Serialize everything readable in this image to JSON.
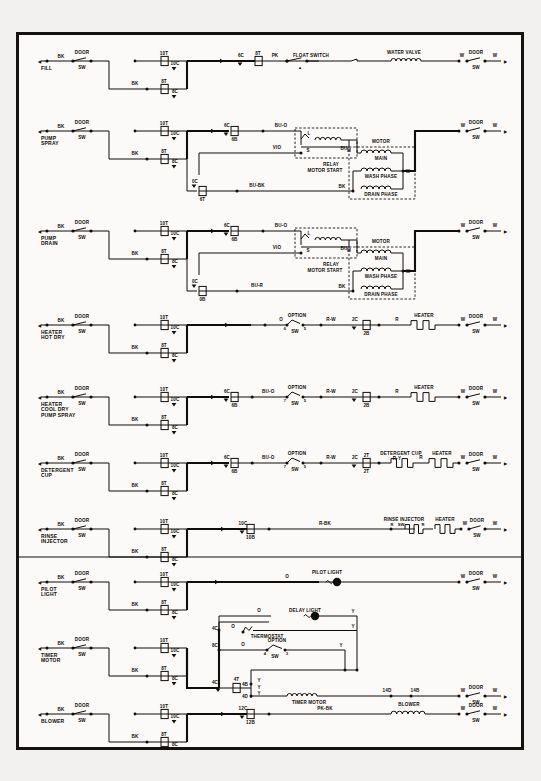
{
  "document": {
    "title": "Dishwasher Ladder Wiring Schematic",
    "background_color": "#f2f1ef",
    "ink_color": "#100d0a",
    "border_color": "#15120f"
  },
  "common": {
    "door": "DOOR",
    "sw": "SW",
    "bk": "BK",
    "w": "W",
    "option": "OPTION",
    "heater": "HEATER",
    "motor": "MOTOR",
    "relay": "RELAY",
    "motor_start": "MOTOR START",
    "main": "MAIN",
    "wash_phase": "WASH PHASE",
    "drain_phase": "DRAIN PHASE",
    "term_10t": "10T",
    "term_10c": "10C",
    "term_8t": "8T",
    "term_8c": "8C",
    "term_6c": "6C",
    "term_6b": "6B",
    "term_6t": "6T",
    "term_0c": "0C",
    "term_0b": "0B",
    "term_2c": "2C",
    "term_2b": "2B",
    "term_2t": "2T",
    "term_10b": "10B",
    "term_12c": "12C",
    "term_12b": "12B",
    "term_4c": "4C",
    "term_4t": "4T",
    "term_4b": "4B",
    "term_4d": "4D",
    "term_8c_low": "8C",
    "term_14d": "14D",
    "term_14b": "14B"
  },
  "rows": [
    {
      "id": "fill",
      "name": "FILL",
      "left_wire": "BK",
      "switch": "DOOR",
      "switch_sub": "SW",
      "mid_wire": "BK",
      "terminals": [
        "10T",
        "10C",
        "8T",
        "8C",
        "6C",
        "8T"
      ],
      "load_wire": "PK",
      "device_a": "FLOAT SWITCH",
      "device_b": "WATER VALVE",
      "right_wire": "W",
      "right_switch": "DOOR",
      "right_switch_sub": "SW",
      "right_end": "W"
    },
    {
      "id": "pump-spray",
      "name": "PUMP SPRAY",
      "name_line1": "PUMP",
      "name_line2": "SPRAY",
      "left_wire": "BK",
      "switch": "DOOR",
      "switch_sub": "SW",
      "mid_wire": "BK",
      "terminals": [
        "10T",
        "10C",
        "8T",
        "8C",
        "6C",
        "6B",
        "0C",
        "6T"
      ],
      "relay_wire_top": "BU-O",
      "relay_wire_mid": "VIO",
      "relay_wire_bot": "BU-BK",
      "relay_terms": [
        "L",
        "S",
        "M"
      ],
      "relay_title1": "RELAY",
      "relay_title2": "MOTOR START",
      "motor_title": "MOTOR",
      "motor_coils": [
        "MAIN",
        "WASH PHASE",
        "DRAIN PHASE"
      ],
      "motor_in_top": "BU",
      "motor_in_bot": "BK",
      "motor_out": "W",
      "right_wire": "W",
      "right_switch": "DOOR",
      "right_switch_sub": "SW",
      "right_end": "W"
    },
    {
      "id": "pump-drain",
      "name": "PUMP DRAIN",
      "name_line1": "PUMP",
      "name_line2": "DRAIN",
      "left_wire": "BK",
      "switch": "DOOR",
      "switch_sub": "SW",
      "mid_wire": "BK",
      "terminals": [
        "10T",
        "10C",
        "8T",
        "8C",
        "6C",
        "6B",
        "0C",
        "0B"
      ],
      "relay_wire_top": "BU-O",
      "relay_wire_mid": "VIO",
      "relay_wire_bot": "BU-R",
      "relay_terms": [
        "L",
        "S",
        "M"
      ],
      "relay_title1": "RELAY",
      "relay_title2": "MOTOR START",
      "motor_title": "MOTOR",
      "motor_coils": [
        "MAIN",
        "WASH PHASE",
        "DRAIN PHASE"
      ],
      "motor_in_top": "BU",
      "motor_in_bot": "BK",
      "motor_out": "W",
      "right_wire": "W",
      "right_switch": "DOOR",
      "right_switch_sub": "SW",
      "right_end": "W"
    },
    {
      "id": "heater-hot-dry",
      "name": "HEATER HOT DRY",
      "name_line1": "HEATER",
      "name_line2": "HOT DRY",
      "left_wire": "BK",
      "switch": "DOOR",
      "switch_sub": "SW",
      "mid_wire": "BK",
      "terminals": [
        "10T",
        "10C",
        "8T",
        "8C",
        "2C",
        "2B"
      ],
      "opt_wire_in": "O",
      "opt_title": "OPTION",
      "opt_sub": "SW",
      "opt_terms": [
        "6",
        "5"
      ],
      "opt_wire_out": "R-W",
      "load_wire": "R",
      "device": "HEATER",
      "right_wire": "W",
      "right_switch": "DOOR",
      "right_switch_sub": "SW",
      "right_end": "W"
    },
    {
      "id": "heater-cool-dry-pump-spray",
      "name": "HEATER COOL DRY PUMP SPRAY",
      "name_line1": "HEATER",
      "name_line2": "COOL DRY",
      "name_line3": "PUMP SPRAY",
      "left_wire": "BK",
      "switch": "DOOR",
      "switch_sub": "SW",
      "mid_wire": "BK",
      "terminals": [
        "10T",
        "10C",
        "8T",
        "8C",
        "6C",
        "6B",
        "2C",
        "2B"
      ],
      "opt_wire_in": "BU-O",
      "opt_title": "OPTION",
      "opt_sub": "SW",
      "opt_terms": [
        "7",
        "5"
      ],
      "opt_wire_out": "R-W",
      "load_wire": "R",
      "device": "HEATER",
      "right_wire": "W",
      "right_switch": "DOOR",
      "right_switch_sub": "SW",
      "right_end": "W"
    },
    {
      "id": "detergent-cup",
      "name": "DETERGENT CUP",
      "name_line1": "DETERGENT",
      "name_line2": "CUP",
      "left_wire": "BK",
      "switch": "DOOR",
      "switch_sub": "SW",
      "mid_wire": "BK",
      "terminals": [
        "10T",
        "10C",
        "8T",
        "8C",
        "6C",
        "6B",
        "2C",
        "2T"
      ],
      "opt_wire_in": "BU-O",
      "opt_title": "OPTION",
      "opt_sub": "SW",
      "opt_terms": [
        "7",
        "5"
      ],
      "opt_wire_out": "R-W",
      "device_a": "DETERGENT CUP",
      "device_a_wire": "R-Y",
      "load_wire": "R",
      "device": "HEATER",
      "right_wire": "W",
      "right_switch": "DOOR",
      "right_switch_sub": "SW",
      "right_end": "W"
    },
    {
      "id": "rinse-injector",
      "name": "RINSE INJECTOR",
      "name_line1": "RINSE",
      "name_line2": "INJECTOR",
      "left_wire": "BK",
      "switch": "DOOR",
      "switch_sub": "SW",
      "mid_wire": "BK",
      "terminals": [
        "10T",
        "10C",
        "8T",
        "8C",
        "10C",
        "10B"
      ],
      "load_wire": "R-BK",
      "device_a": "RINSE INJECTOR",
      "device_a_in": "R",
      "device_a_out": "R",
      "device_a_sub": "SW",
      "device": "HEATER",
      "right_wire": "W",
      "right_switch": "DOOR",
      "right_switch_sub": "SW",
      "right_end": "W"
    },
    {
      "id": "pilot-light",
      "name": "PILOT LIGHT",
      "name_line1": "PILOT",
      "name_line2": "LIGHT",
      "left_wire": "BK",
      "switch": "DOOR",
      "switch_sub": "SW",
      "mid_wire": "BK",
      "terminals": [
        "10T",
        "10C",
        "8T",
        "8C"
      ],
      "load_wire": "O",
      "device": "PILOT LIGHT",
      "right_wire": "W",
      "right_switch": "DOOR",
      "right_switch_sub": "SW",
      "right_end": "W"
    },
    {
      "id": "timer-motor",
      "name": "TIMER MOTOR",
      "name_line1": "TIMER",
      "name_line2": "MOTOR",
      "left_wire": "BK",
      "switch": "DOOR",
      "switch_sub": "SW",
      "mid_wire": "BK",
      "terminals": [
        "10T",
        "10C",
        "8T",
        "8C",
        "4C",
        "4T",
        "4B",
        "4D",
        "8C",
        "14D",
        "14B"
      ],
      "delay_in": "O",
      "delay_device": "DELAY LIGHT",
      "delay_out": "Y",
      "thermostat": "THERMOSTAT",
      "thermostat_in": "O",
      "thermostat_out": "Y",
      "opt_title": "OPTION",
      "opt_sub": "SW",
      "opt_in": "O",
      "opt_out": "Y",
      "opt_terms": [
        "4",
        "3"
      ],
      "tm_wire": "Y",
      "tm_device": "TIMER MOTOR",
      "right_wire": "W",
      "right_switch": "DOOR",
      "right_switch_sub": "SW",
      "right_end": "W"
    },
    {
      "id": "blower",
      "name": "BLOWER",
      "name_line1": "BLOWER",
      "left_wire": "BK",
      "switch": "DOOR",
      "switch_sub": "SW",
      "mid_wire": "BK",
      "terminals": [
        "10T",
        "10C",
        "8T",
        "8C",
        "12C",
        "12B"
      ],
      "load_wire": "PK-BK",
      "device": "BLOWER",
      "right_wire": "W",
      "right_switch": "DOOR",
      "right_switch_sub": "SW",
      "right_end": "W"
    }
  ]
}
